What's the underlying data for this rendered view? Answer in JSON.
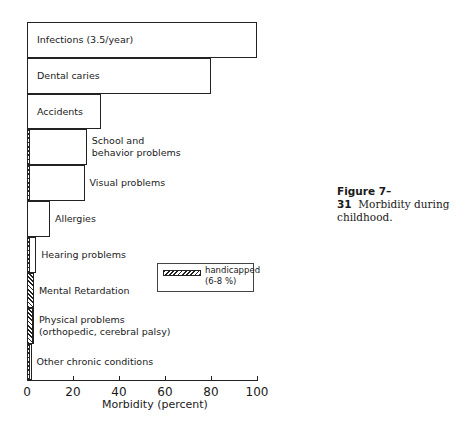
{
  "chart_data": {
    "type": "bar",
    "orientation": "horizontal",
    "title": "",
    "xlabel": "Morbidity (percent)",
    "ylabel": "",
    "xlim": [
      0,
      100
    ],
    "xticks": [
      0,
      20,
      40,
      60,
      80,
      100
    ],
    "grid": false,
    "categories": [
      "Infections (3.5/year)",
      "Dental caries",
      "Accidents",
      "School and\nbehavior problems",
      "Visual problems",
      "Allergies",
      "Hearing problems",
      "Mental Retardation",
      "Physical problems\n(orthopedic, cerebral palsy)",
      "Other chronic conditions"
    ],
    "series": [
      {
        "name": "total",
        "values": [
          100,
          80,
          32,
          26,
          25,
          10,
          4,
          3,
          3,
          2
        ]
      },
      {
        "name": "handicapped (6-8 %)",
        "values": [
          0,
          0,
          0,
          1.5,
          1.5,
          0,
          1.5,
          3,
          2.5,
          1.5
        ],
        "pattern": "hatched"
      }
    ],
    "legend": {
      "position": "inside right",
      "entries": [
        "handicapped\n(6-8 %)"
      ]
    }
  },
  "caption": {
    "label": "Figure 7–31",
    "text": "Morbidity during\nchildhood."
  }
}
